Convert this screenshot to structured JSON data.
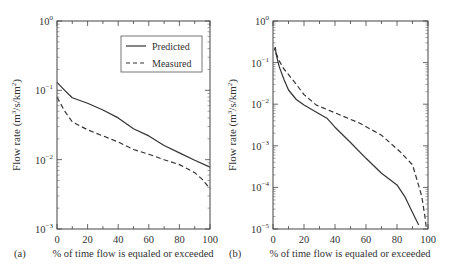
{
  "figure": {
    "panels": [
      "(a)",
      "(b)"
    ]
  },
  "legend": {
    "predicted_label": "Predicted",
    "measured_label": "Measured"
  },
  "chart_data": [
    {
      "type": "line",
      "panel_label": "(a)",
      "title": "",
      "xlabel": "% of time flow is equaled or exceeded",
      "ylabel": "Flow rate (m3/s/km2)",
      "yscale": "log",
      "xlim": [
        0,
        100
      ],
      "ylim": [
        0.001,
        1
      ],
      "xticks": [
        0,
        20,
        40,
        60,
        80,
        100
      ],
      "xtick_labels": [
        "0",
        "20",
        "40",
        "60",
        "80",
        "100"
      ],
      "yticks": [
        1,
        0.1,
        0.01,
        0.001
      ],
      "ytick_labels": [
        [
          "10",
          "0"
        ],
        [
          "10",
          "−1"
        ],
        [
          "10",
          "−2"
        ],
        [
          "10",
          "−3"
        ]
      ],
      "grid": false,
      "legend_position": "upper right",
      "series": [
        {
          "name": "Predicted",
          "style": "solid",
          "x": [
            0,
            5,
            10,
            20,
            30,
            40,
            50,
            60,
            70,
            80,
            90,
            100
          ],
          "y": [
            0.13,
            0.1,
            0.078,
            0.065,
            0.052,
            0.04,
            0.028,
            0.022,
            0.016,
            0.0125,
            0.0098,
            0.0078
          ]
        },
        {
          "name": "Measured",
          "style": "dashed",
          "x": [
            0,
            5,
            10,
            20,
            30,
            40,
            50,
            60,
            70,
            80,
            90,
            95,
            100
          ],
          "y": [
            0.08,
            0.05,
            0.035,
            0.027,
            0.022,
            0.018,
            0.014,
            0.012,
            0.01,
            0.0085,
            0.0065,
            0.0052,
            0.0038
          ]
        }
      ]
    },
    {
      "type": "line",
      "panel_label": "(b)",
      "title": "",
      "xlabel": "% of time flow is equaled or exceeded",
      "ylabel": "Flow rate (m3/s/km2)",
      "yscale": "log",
      "xlim": [
        0,
        100
      ],
      "ylim": [
        1e-05,
        1
      ],
      "xticks": [
        0,
        20,
        40,
        60,
        80,
        100
      ],
      "xtick_labels": [
        "0",
        "20",
        "40",
        "60",
        "80",
        "100"
      ],
      "yticks": [
        1,
        0.1,
        0.01,
        0.001,
        0.0001,
        1e-05
      ],
      "ytick_labels": [
        [
          "10",
          "0"
        ],
        [
          "10",
          "−1"
        ],
        [
          "10",
          "−2"
        ],
        [
          "10",
          "−3"
        ],
        [
          "10",
          "−4"
        ],
        [
          "10",
          "−5"
        ]
      ],
      "grid": false,
      "legend_position": "none",
      "series": [
        {
          "name": "Predicted",
          "style": "solid",
          "x": [
            1,
            1.5,
            2,
            4,
            7,
            10,
            15,
            20,
            30,
            35,
            40,
            50,
            60,
            70,
            80,
            85,
            90,
            94
          ],
          "y": [
            0.2,
            0.23,
            0.16,
            0.08,
            0.04,
            0.022,
            0.013,
            0.0095,
            0.0058,
            0.0045,
            0.0028,
            0.0012,
            0.0005,
            0.00022,
            0.000115,
            6e-05,
            2.5e-05,
            1.25e-05
          ]
        },
        {
          "name": "Measured",
          "style": "dashed",
          "x": [
            1,
            1.5,
            2,
            4,
            7,
            11,
            15,
            20,
            28,
            40,
            56,
            70,
            82,
            90,
            94,
            96,
            98,
            99
          ],
          "y": [
            0.2,
            0.23,
            0.17,
            0.11,
            0.07,
            0.046,
            0.03,
            0.017,
            0.0095,
            0.0062,
            0.0035,
            0.0018,
            0.00072,
            0.00035,
            0.00011,
            6e-05,
            2e-05,
            1e-05
          ]
        }
      ]
    }
  ]
}
